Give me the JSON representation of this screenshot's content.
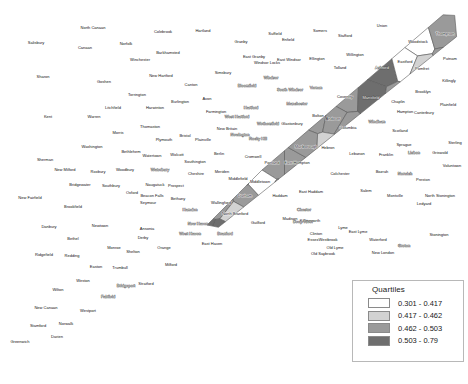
{
  "map": {
    "title": "Connecticut Towns Choropleth",
    "region": "Connecticut",
    "palette": {
      "q1": "#ffffff",
      "q2": "#d2d2d2",
      "q3": "#9a9a9a",
      "q4": "#6e6e6e",
      "border": "#5a5a5a",
      "background": "#ffffff"
    }
  },
  "legend": {
    "title": "Quartiles",
    "items": [
      {
        "swatch": "q1",
        "label": "0.301 - 0.417"
      },
      {
        "swatch": "q2",
        "label": "0.417 - 0.462"
      },
      {
        "swatch": "q3",
        "label": "0.462 - 0.503"
      },
      {
        "swatch": "q4",
        "label": "0.503 - 0.79"
      }
    ]
  },
  "chart_data": {
    "type": "choropleth",
    "title": "Quartiles",
    "classes": [
      {
        "name": "0.301 - 0.417",
        "color": "#ffffff",
        "min": 0.301,
        "max": 0.417
      },
      {
        "name": "0.417 - 0.462",
        "color": "#d2d2d2",
        "min": 0.417,
        "max": 0.462
      },
      {
        "name": "0.462 - 0.503",
        "color": "#9a9a9a",
        "min": 0.462,
        "max": 0.503
      },
      {
        "name": "0.503 - 0.79",
        "color": "#6e6e6e",
        "min": 0.503,
        "max": 0.79
      }
    ],
    "regions": [
      {
        "name": "Salisbury",
        "q": 3,
        "x": 36,
        "y": 43
      },
      {
        "name": "North Canaan",
        "q": 3,
        "x": 93,
        "y": 28
      },
      {
        "name": "Canaan",
        "q": 3,
        "x": 85,
        "y": 48
      },
      {
        "name": "Norfolk",
        "q": 3,
        "x": 126,
        "y": 44
      },
      {
        "name": "Colebrook",
        "q": 2,
        "x": 163,
        "y": 32
      },
      {
        "name": "Hartland",
        "q": 1,
        "x": 203,
        "y": 31
      },
      {
        "name": "Granby",
        "q": 1,
        "x": 241,
        "y": 42
      },
      {
        "name": "Suffield",
        "q": 1,
        "x": 275,
        "y": 34
      },
      {
        "name": "Somers",
        "q": 2,
        "x": 320,
        "y": 31
      },
      {
        "name": "Stafford",
        "q": 2,
        "x": 345,
        "y": 36
      },
      {
        "name": "Union",
        "q": 1,
        "x": 382,
        "y": 26
      },
      {
        "name": "Woodstock",
        "q": 1,
        "x": 418,
        "y": 42
      },
      {
        "name": "Thompson",
        "q": 3,
        "x": 445,
        "y": 34
      },
      {
        "name": "Barkhamsted",
        "q": 2,
        "x": 168,
        "y": 53
      },
      {
        "name": "Winchester",
        "q": 3,
        "x": 140,
        "y": 60
      },
      {
        "name": "Sharon",
        "q": 2,
        "x": 43,
        "y": 77
      },
      {
        "name": "Goshen",
        "q": 1,
        "x": 104,
        "y": 82
      },
      {
        "name": "New Hartford",
        "q": 3,
        "x": 161,
        "y": 76
      },
      {
        "name": "Simsbury",
        "q": 2,
        "x": 223,
        "y": 73
      },
      {
        "name": "East Granby",
        "q": 2,
        "x": 254,
        "y": 57
      },
      {
        "name": "Windsor Locks",
        "q": 2,
        "x": 267,
        "y": 63
      },
      {
        "name": "East Windsor",
        "q": 3,
        "x": 289,
        "y": 60
      },
      {
        "name": "Enfield",
        "q": 3,
        "x": 288,
        "y": 40
      },
      {
        "name": "Ellington",
        "q": 3,
        "x": 317,
        "y": 59
      },
      {
        "name": "Tolland",
        "q": 2,
        "x": 340,
        "y": 68
      },
      {
        "name": "Willington",
        "q": 2,
        "x": 355,
        "y": 55
      },
      {
        "name": "Ashford",
        "q": 4,
        "x": 382,
        "y": 68
      },
      {
        "name": "Eastford",
        "q": 1,
        "x": 405,
        "y": 62
      },
      {
        "name": "Pomfret",
        "q": 2,
        "x": 422,
        "y": 69
      },
      {
        "name": "Putnam",
        "q": 3,
        "x": 450,
        "y": 59
      },
      {
        "name": "Killingly",
        "q": 3,
        "x": 449,
        "y": 81
      },
      {
        "name": "Brooklyn",
        "q": 3,
        "x": 423,
        "y": 92
      },
      {
        "name": "Canton",
        "q": 2,
        "x": 191,
        "y": 85
      },
      {
        "name": "Windsor",
        "q": 4,
        "x": 271,
        "y": 78
      },
      {
        "name": "Bloomfield",
        "q": 4,
        "x": 247,
        "y": 86
      },
      {
        "name": "Litchfield",
        "q": 1,
        "x": 113,
        "y": 108
      },
      {
        "name": "Harwinton",
        "q": 1,
        "x": 155,
        "y": 108
      },
      {
        "name": "Torrington",
        "q": 3,
        "x": 137,
        "y": 95
      },
      {
        "name": "Burlington",
        "q": 1,
        "x": 180,
        "y": 102
      },
      {
        "name": "Avon",
        "q": 1,
        "x": 207,
        "y": 99
      },
      {
        "name": "Farmington",
        "q": 3,
        "x": 216,
        "y": 112
      },
      {
        "name": "Hartford",
        "q": 4,
        "x": 251,
        "y": 108
      },
      {
        "name": "South Windsor",
        "q": 4,
        "x": 290,
        "y": 90
      },
      {
        "name": "Manchester",
        "q": 4,
        "x": 297,
        "y": 104
      },
      {
        "name": "Vernon",
        "q": 4,
        "x": 316,
        "y": 88
      },
      {
        "name": "Coventry",
        "q": 3,
        "x": 345,
        "y": 97
      },
      {
        "name": "Mansfield",
        "q": 4,
        "x": 371,
        "y": 98
      },
      {
        "name": "Chaplin",
        "q": 3,
        "x": 398,
        "y": 102
      },
      {
        "name": "Hampton",
        "q": 3,
        "x": 405,
        "y": 112
      },
      {
        "name": "Canterbury",
        "q": 1,
        "x": 424,
        "y": 113
      },
      {
        "name": "Plainfield",
        "q": 3,
        "x": 448,
        "y": 105
      },
      {
        "name": "Kent",
        "q": 3,
        "x": 48,
        "y": 117
      },
      {
        "name": "Warren",
        "q": 1,
        "x": 94,
        "y": 117
      },
      {
        "name": "Morris",
        "q": 1,
        "x": 118,
        "y": 133
      },
      {
        "name": "Thomaston",
        "q": 3,
        "x": 150,
        "y": 127
      },
      {
        "name": "Plymouth",
        "q": 3,
        "x": 164,
        "y": 140
      },
      {
        "name": "Bristol",
        "q": 3,
        "x": 185,
        "y": 136
      },
      {
        "name": "Plainville",
        "q": 2,
        "x": 203,
        "y": 140
      },
      {
        "name": "New Britain",
        "q": 3,
        "x": 227,
        "y": 129
      },
      {
        "name": "West Hartford",
        "q": 4,
        "x": 237,
        "y": 117
      },
      {
        "name": "Newington",
        "q": 4,
        "x": 240,
        "y": 135
      },
      {
        "name": "Wethersfield",
        "q": 4,
        "x": 268,
        "y": 124
      },
      {
        "name": "Rocky Hill",
        "q": 4,
        "x": 258,
        "y": 139
      },
      {
        "name": "Glastonbury",
        "q": 3,
        "x": 292,
        "y": 124
      },
      {
        "name": "Bolton",
        "q": 3,
        "x": 318,
        "y": 116
      },
      {
        "name": "Andover",
        "q": 3,
        "x": 333,
        "y": 119
      },
      {
        "name": "Columbia",
        "q": 3,
        "x": 348,
        "y": 128
      },
      {
        "name": "Windham",
        "q": 4,
        "x": 377,
        "y": 122
      },
      {
        "name": "Scotland",
        "q": 2,
        "x": 400,
        "y": 131
      },
      {
        "name": "Sprague",
        "q": 3,
        "x": 404,
        "y": 145
      },
      {
        "name": "Lisbon",
        "q": 4,
        "x": 414,
        "y": 153
      },
      {
        "name": "Griswold",
        "q": 3,
        "x": 440,
        "y": 153
      },
      {
        "name": "Sterling",
        "q": 2,
        "x": 455,
        "y": 143
      },
      {
        "name": "Voluntown",
        "q": 2,
        "x": 452,
        "y": 166
      },
      {
        "name": "Washington",
        "q": 2,
        "x": 92,
        "y": 147
      },
      {
        "name": "Bethlehem",
        "q": 2,
        "x": 131,
        "y": 152
      },
      {
        "name": "Watertown",
        "q": 3,
        "x": 152,
        "y": 156
      },
      {
        "name": "Wolcott",
        "q": 1,
        "x": 177,
        "y": 155
      },
      {
        "name": "Berlin",
        "q": 3,
        "x": 219,
        "y": 154
      },
      {
        "name": "Cromwell",
        "q": 3,
        "x": 253,
        "y": 157
      },
      {
        "name": "Portland",
        "q": 3,
        "x": 272,
        "y": 163
      },
      {
        "name": "East Hampton",
        "q": 3,
        "x": 297,
        "y": 163
      },
      {
        "name": "Marlborough",
        "q": 3,
        "x": 306,
        "y": 147
      },
      {
        "name": "Hebron",
        "q": 2,
        "x": 328,
        "y": 148
      },
      {
        "name": "Lebanon",
        "q": 1,
        "x": 357,
        "y": 154
      },
      {
        "name": "Franklin",
        "q": 1,
        "x": 386,
        "y": 155
      },
      {
        "name": "Sherman",
        "q": 1,
        "x": 45,
        "y": 160
      },
      {
        "name": "New Milford",
        "q": 2,
        "x": 65,
        "y": 170
      },
      {
        "name": "Roxbury",
        "q": 1,
        "x": 98,
        "y": 172
      },
      {
        "name": "Woodbury",
        "q": 1,
        "x": 125,
        "y": 170
      },
      {
        "name": "Waterbury",
        "q": 4,
        "x": 160,
        "y": 170
      },
      {
        "name": "Cheshire",
        "q": 1,
        "x": 196,
        "y": 174
      },
      {
        "name": "Southington",
        "q": 2,
        "x": 195,
        "y": 162
      },
      {
        "name": "Meriden",
        "q": 3,
        "x": 222,
        "y": 172
      },
      {
        "name": "Middletown",
        "q": 1,
        "x": 260,
        "y": 182
      },
      {
        "name": "Middlefield",
        "q": 3,
        "x": 238,
        "y": 179
      },
      {
        "name": "Durham",
        "q": 3,
        "x": 245,
        "y": 196
      },
      {
        "name": "Haddam",
        "q": 3,
        "x": 280,
        "y": 196
      },
      {
        "name": "East Haddam",
        "q": 1,
        "x": 311,
        "y": 192
      },
      {
        "name": "Colchester",
        "q": 3,
        "x": 340,
        "y": 174
      },
      {
        "name": "Salem",
        "q": 1,
        "x": 366,
        "y": 191
      },
      {
        "name": "Bozrah",
        "q": 1,
        "x": 382,
        "y": 172
      },
      {
        "name": "Norwich",
        "q": 4,
        "x": 405,
        "y": 174
      },
      {
        "name": "Montville",
        "q": 3,
        "x": 395,
        "y": 196
      },
      {
        "name": "Preston",
        "q": 2,
        "x": 423,
        "y": 180
      },
      {
        "name": "North Stonington",
        "q": 1,
        "x": 440,
        "y": 196
      },
      {
        "name": "Ledyard",
        "q": 1,
        "x": 424,
        "y": 204
      },
      {
        "name": "New Fairfield",
        "q": 1,
        "x": 30,
        "y": 198
      },
      {
        "name": "Bridgewater",
        "q": 1,
        "x": 80,
        "y": 185
      },
      {
        "name": "Southbury",
        "q": 1,
        "x": 111,
        "y": 186
      },
      {
        "name": "Oxford",
        "q": 1,
        "x": 132,
        "y": 193
      },
      {
        "name": "Naugatuck",
        "q": 3,
        "x": 155,
        "y": 185
      },
      {
        "name": "Prospect",
        "q": 2,
        "x": 176,
        "y": 186
      },
      {
        "name": "Bethany",
        "q": 2,
        "x": 178,
        "y": 199
      },
      {
        "name": "Seymour",
        "q": 2,
        "x": 148,
        "y": 203
      },
      {
        "name": "Beacon Falls",
        "q": 2,
        "x": 152,
        "y": 196
      },
      {
        "name": "Wallingford",
        "q": 3,
        "x": 221,
        "y": 203
      },
      {
        "name": "Hamden",
        "q": 4,
        "x": 190,
        "y": 210
      },
      {
        "name": "North Branford",
        "q": 2,
        "x": 235,
        "y": 214
      },
      {
        "name": "Branford",
        "q": 4,
        "x": 225,
        "y": 234
      },
      {
        "name": "Guilford",
        "q": 2,
        "x": 258,
        "y": 223
      },
      {
        "name": "Madison",
        "q": 2,
        "x": 290,
        "y": 219
      },
      {
        "name": "Killingworth",
        "q": 2,
        "x": 310,
        "y": 221
      },
      {
        "name": "Clinton",
        "q": 1,
        "x": 316,
        "y": 234
      },
      {
        "name": "Westbrook",
        "q": 2,
        "x": 328,
        "y": 240
      },
      {
        "name": "Chester",
        "q": 4,
        "x": 304,
        "y": 210
      },
      {
        "name": "Deep River",
        "q": 4,
        "x": 303,
        "y": 222
      },
      {
        "name": "Essex",
        "q": 2,
        "x": 313,
        "y": 240
      },
      {
        "name": "Old Saybrook",
        "q": 2,
        "x": 323,
        "y": 254
      },
      {
        "name": "Lyme",
        "q": 2,
        "x": 343,
        "y": 228
      },
      {
        "name": "Old Lyme",
        "q": 2,
        "x": 335,
        "y": 248
      },
      {
        "name": "East Lyme",
        "q": 2,
        "x": 358,
        "y": 232
      },
      {
        "name": "Waterford",
        "q": 2,
        "x": 378,
        "y": 240
      },
      {
        "name": "New London",
        "q": 1,
        "x": 383,
        "y": 253
      },
      {
        "name": "Groton",
        "q": 4,
        "x": 404,
        "y": 246
      },
      {
        "name": "Stonington",
        "q": 3,
        "x": 439,
        "y": 235
      },
      {
        "name": "Danbury",
        "q": 3,
        "x": 49,
        "y": 227
      },
      {
        "name": "Brookfield",
        "q": 1,
        "x": 73,
        "y": 207
      },
      {
        "name": "Newtown",
        "q": 3,
        "x": 100,
        "y": 226
      },
      {
        "name": "Bethel",
        "q": 1,
        "x": 73,
        "y": 239
      },
      {
        "name": "Redding",
        "q": 1,
        "x": 72,
        "y": 256
      },
      {
        "name": "Ridgefield",
        "q": 1,
        "x": 44,
        "y": 255
      },
      {
        "name": "Monroe",
        "q": 1,
        "x": 114,
        "y": 248
      },
      {
        "name": "Shelton",
        "q": 1,
        "x": 133,
        "y": 252
      },
      {
        "name": "Derby",
        "q": 2,
        "x": 143,
        "y": 238
      },
      {
        "name": "Ansonia",
        "q": 2,
        "x": 147,
        "y": 229
      },
      {
        "name": "Orange",
        "q": 1,
        "x": 164,
        "y": 248
      },
      {
        "name": "West Haven",
        "q": 4,
        "x": 190,
        "y": 234
      },
      {
        "name": "New Haven",
        "q": 4,
        "x": 198,
        "y": 224
      },
      {
        "name": "East Haven",
        "q": 3,
        "x": 212,
        "y": 244
      },
      {
        "name": "Milford",
        "q": 2,
        "x": 171,
        "y": 265
      },
      {
        "name": "Trumbull",
        "q": 1,
        "x": 120,
        "y": 268
      },
      {
        "name": "Easton",
        "q": 1,
        "x": 96,
        "y": 267
      },
      {
        "name": "Weston",
        "q": 1,
        "x": 83,
        "y": 281
      },
      {
        "name": "Stratford",
        "q": 3,
        "x": 146,
        "y": 284
      },
      {
        "name": "Bridgeport",
        "q": 4,
        "x": 126,
        "y": 286
      },
      {
        "name": "Fairfield",
        "q": 4,
        "x": 108,
        "y": 297
      },
      {
        "name": "Wilton",
        "q": 1,
        "x": 58,
        "y": 290
      },
      {
        "name": "Westport",
        "q": 3,
        "x": 88,
        "y": 311
      },
      {
        "name": "New Canaan",
        "q": 3,
        "x": 46,
        "y": 308
      },
      {
        "name": "Norwalk",
        "q": 1,
        "x": 66,
        "y": 324
      },
      {
        "name": "Darien",
        "q": 3,
        "x": 57,
        "y": 337
      },
      {
        "name": "Stamford",
        "q": 3,
        "x": 38,
        "y": 326
      },
      {
        "name": "Greenwich",
        "q": 1,
        "x": 20,
        "y": 342
      }
    ]
  }
}
